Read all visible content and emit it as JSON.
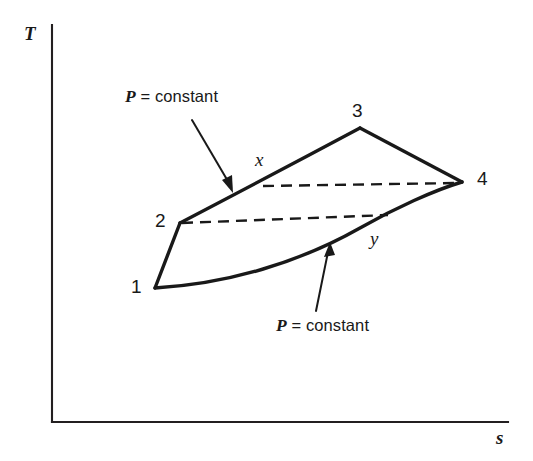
{
  "figure": {
    "type": "thermodynamic-T-s-diagram",
    "axes": {
      "y_label": "T",
      "x_label": "s",
      "y_axis": {
        "x": 52,
        "y_top": 25,
        "y_bottom": 422
      },
      "x_axis": {
        "y": 422,
        "x_left": 52,
        "x_right": 508
      },
      "ticks": "none",
      "grid": "off"
    },
    "state_points": [
      {
        "id": "1",
        "label": "1",
        "x": 155,
        "y": 288,
        "label_x": 131,
        "label_y": 277
      },
      {
        "id": "2",
        "label": "2",
        "x": 180,
        "y": 223,
        "label_x": 155,
        "label_y": 211
      },
      {
        "id": "3",
        "label": "3",
        "x": 360,
        "y": 128,
        "label_x": 352,
        "label_y": 101
      },
      {
        "id": "4",
        "label": "4",
        "x": 462,
        "y": 182,
        "label_x": 477,
        "label_y": 169
      },
      {
        "id": "x",
        "label": "x",
        "x": 263,
        "y": 185,
        "label_x": 255,
        "label_y": 150
      },
      {
        "id": "y",
        "label": "y",
        "x": 385,
        "y": 216,
        "label_x": 370,
        "label_y": 229
      }
    ],
    "paths": [
      {
        "name": "compression-1-2",
        "style": "solid",
        "from": "1",
        "to": "2"
      },
      {
        "name": "upper-isobar-2-x-3",
        "style": "solid",
        "from": "2",
        "to": "3"
      },
      {
        "name": "expansion-3-4",
        "style": "solid",
        "from": "3",
        "to": "4"
      },
      {
        "name": "lower-isobar-1-y-4",
        "style": "solid",
        "from": "1",
        "to": "4"
      },
      {
        "name": "regenerator-line-x-4",
        "style": "dashed",
        "from": "x",
        "to": "4"
      },
      {
        "name": "regenerator-line-2-y",
        "style": "dashed",
        "from": "2",
        "to": "y"
      }
    ],
    "annotations": [
      {
        "id": "upper-pressure-label",
        "symbol": "P",
        "text": " = constant",
        "label_x": 125,
        "label_y": 88,
        "arrow_from_x": 192,
        "arrow_from_y": 120,
        "arrow_to_x": 233,
        "arrow_to_y": 192
      },
      {
        "id": "lower-pressure-label",
        "symbol": "P",
        "text": " = constant",
        "label_x": 276,
        "label_y": 317,
        "arrow_from_x": 316,
        "arrow_from_y": 311,
        "arrow_to_x": 330,
        "arrow_to_y": 243
      }
    ],
    "colors": {
      "ink": "#191919",
      "axis": "#231f20",
      "background": "#ffffff"
    }
  }
}
